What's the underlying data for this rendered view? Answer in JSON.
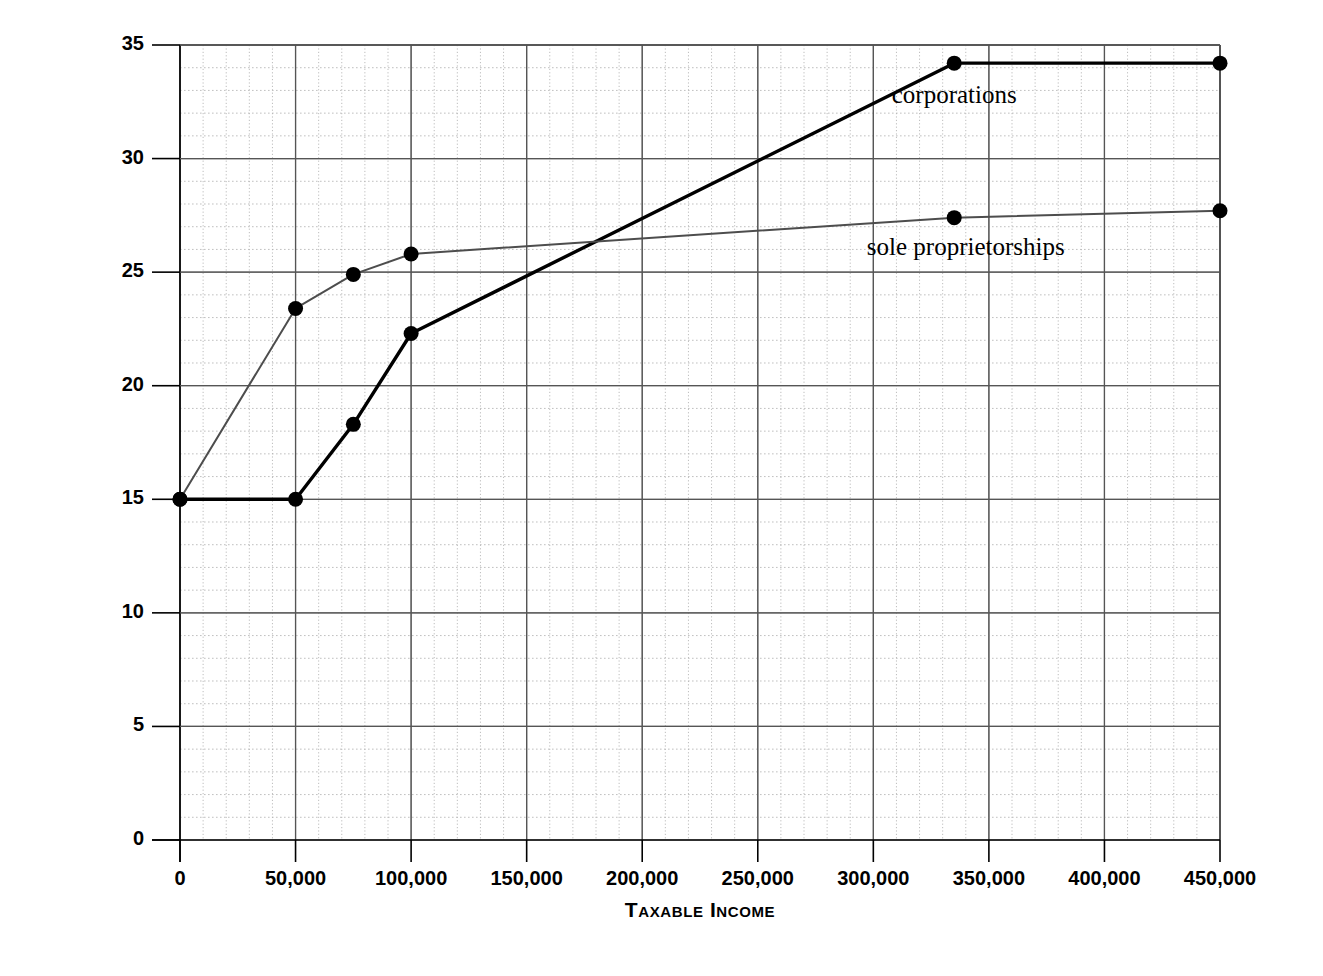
{
  "chart_data": {
    "type": "line",
    "title": "",
    "xlabel": "Taxable Income",
    "ylabel": "Marginal Tax Rate",
    "xlim": [
      0,
      450000
    ],
    "ylim": [
      0,
      35
    ],
    "grid": true,
    "x_ticks": [
      0,
      50000,
      100000,
      150000,
      200000,
      250000,
      300000,
      350000,
      400000,
      450000
    ],
    "x_tick_labels": [
      "0",
      "50,000",
      "100,000",
      "150,000",
      "200,000",
      "250,000",
      "300,000",
      "350,000",
      "400,000",
      "450,000"
    ],
    "y_ticks": [
      0,
      5,
      10,
      15,
      20,
      25,
      30,
      35
    ],
    "y_tick_labels": [
      "0",
      "5",
      "10",
      "15",
      "20",
      "25",
      "30",
      "35"
    ],
    "x_minor_step": 10000,
    "y_minor_step": 1,
    "legend_position": "inline-annotations",
    "series": [
      {
        "name": "corporations",
        "color": "#000000",
        "line_width": 3.4,
        "marker": "circle",
        "label_x": 335000,
        "label_y": 32.7,
        "points": [
          {
            "x": 0,
            "y": 15.0
          },
          {
            "x": 50000,
            "y": 15.0
          },
          {
            "x": 75000,
            "y": 18.3
          },
          {
            "x": 100000,
            "y": 22.3
          },
          {
            "x": 335000,
            "y": 34.2
          },
          {
            "x": 450000,
            "y": 34.2
          }
        ]
      },
      {
        "name": "sole proprietorships",
        "color": "#4d4d4d",
        "line_width": 2.0,
        "marker": "circle",
        "label_x": 340000,
        "label_y": 26.0,
        "points": [
          {
            "x": 0,
            "y": 15.0
          },
          {
            "x": 50000,
            "y": 23.4
          },
          {
            "x": 75000,
            "y": 24.9
          },
          {
            "x": 100000,
            "y": 25.8
          },
          {
            "x": 335000,
            "y": 27.4
          },
          {
            "x": 450000,
            "y": 27.7
          }
        ]
      }
    ]
  },
  "axes": {
    "y_title": "Marginal Tax Rate",
    "x_title": "Taxable Income"
  },
  "colors": {
    "corporations": "#000000",
    "sole_proprietorships": "#4d4d4d",
    "grid_major": "#808080",
    "grid_minor": "#b5b5b5",
    "axis": "#000000",
    "background": "#ffffff"
  }
}
